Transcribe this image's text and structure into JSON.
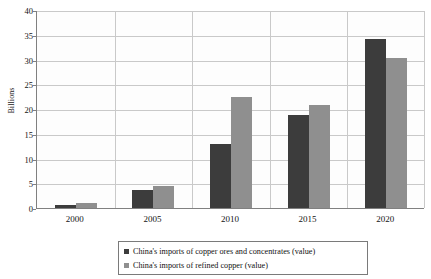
{
  "chart_data": {
    "type": "bar",
    "title": "",
    "subtitle": "",
    "xlabel": "",
    "ylabel": "Billions",
    "categories": [
      "2000",
      "2005",
      "2010",
      "2015",
      "2020"
    ],
    "series": [
      {
        "name": "China's imports of copper ores and concentrates (value)",
        "color": "#3c3c3c",
        "values": [
          0.6,
          3.6,
          13.0,
          18.8,
          34.2
        ]
      },
      {
        "name": "China's imports of refined copper (value)",
        "color": "#8f8f8f",
        "values": [
          1.1,
          4.4,
          22.4,
          20.8,
          30.4
        ]
      }
    ],
    "ylim": [
      0,
      40
    ],
    "ytick_step": 5,
    "yticks": [
      "0",
      "5",
      "10",
      "15",
      "20",
      "25",
      "30",
      "35",
      "40"
    ],
    "grid": "horizontal-and-vertical",
    "legend_position": "bottom-center",
    "legend_border_color": "#7a7a7a",
    "plot_background": "#fdfdfd",
    "axis_color": "#808080",
    "gridline_color": "#c9c9c9"
  }
}
